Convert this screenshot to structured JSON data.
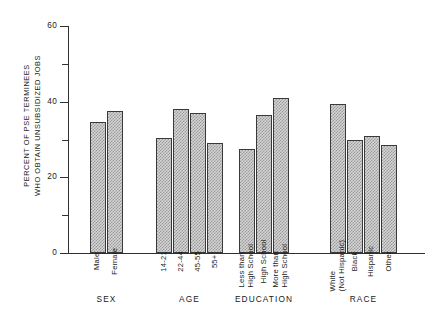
{
  "chart_data": {
    "type": "bar",
    "title": "",
    "xlabel": "",
    "ylabel_lines": [
      "PERCENT OF PSE TERMINEES",
      "WHO OBTAIN UNSUBSIDIZED JOBS"
    ],
    "ylim": [
      0,
      60
    ],
    "yticks_major": [
      0,
      20,
      40,
      60
    ],
    "yticks_minor": [
      10,
      30,
      50
    ],
    "ytick_labels": [
      "0",
      "20",
      "40",
      "60"
    ],
    "grid": false,
    "legend": "none",
    "groups": [
      {
        "title": "SEX",
        "categories": [
          {
            "label_lines": [
              "Male"
            ],
            "value": 34.5
          },
          {
            "label_lines": [
              "Female"
            ],
            "value": 37.5
          }
        ]
      },
      {
        "title": "AGE",
        "categories": [
          {
            "label_lines": [
              "14-21"
            ],
            "value": 30.5
          },
          {
            "label_lines": [
              "22-44"
            ],
            "value": 38.0
          },
          {
            "label_lines": [
              "45-55"
            ],
            "value": 37.0
          },
          {
            "label_lines": [
              "55+"
            ],
            "value": 29.0
          }
        ]
      },
      {
        "title": "EDUCATION",
        "categories": [
          {
            "label_lines": [
              "Less than",
              "High School"
            ],
            "value": 27.5
          },
          {
            "label_lines": [
              "High School"
            ],
            "value": 36.5
          },
          {
            "label_lines": [
              "More than",
              "High School"
            ],
            "value": 41.0
          }
        ]
      },
      {
        "title": "RACE",
        "categories": [
          {
            "label_lines": [
              "White",
              "(Not Hispanic)"
            ],
            "value": 39.5
          },
          {
            "label_lines": [
              "Black"
            ],
            "value": 30.0
          },
          {
            "label_lines": [
              "Hispanic"
            ],
            "value": 31.0
          },
          {
            "label_lines": [
              "Other"
            ],
            "value": 28.5
          }
        ]
      }
    ]
  },
  "style": {
    "bar_fill": "#d4d4d4",
    "bar_stroke": "#3a3a3a",
    "axis_color": "#303030",
    "text_color": "#1a1a1a",
    "background": "#ffffff"
  },
  "layout": {
    "bar_width": 16,
    "group_gap": 30,
    "plot_left": 68,
    "plot_top": 26,
    "plot_width": 357,
    "plot_height": 227,
    "group_starts": [
      22,
      88,
      171,
      262
    ]
  }
}
